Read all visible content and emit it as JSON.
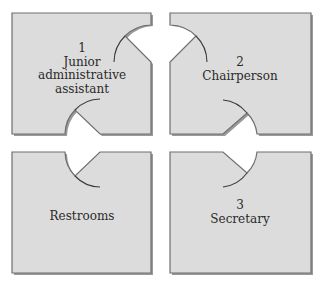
{
  "diagram": {
    "type": "office floor plan",
    "rooms": [
      {
        "id": "room-1",
        "number": "1",
        "name_lines": [
          "Junior",
          "administrative",
          "assistant"
        ]
      },
      {
        "id": "room-2",
        "number": "2",
        "name_lines": [
          "Chairperson"
        ]
      },
      {
        "id": "restrooms",
        "number": "",
        "name_lines": [
          "Restrooms"
        ]
      },
      {
        "id": "room-3",
        "number": "3",
        "name_lines": [
          "Secretary"
        ]
      }
    ],
    "colors": {
      "room_fill": "#dcdcdc",
      "room_border": "#6e6e6e",
      "background": "#ffffff"
    }
  }
}
